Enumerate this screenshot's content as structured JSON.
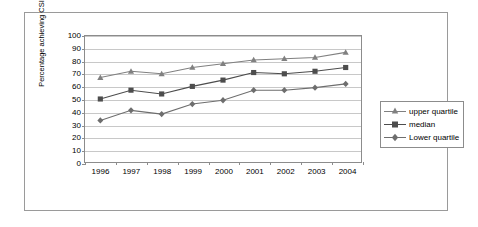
{
  "chart_data": {
    "type": "line",
    "title": "",
    "xlabel": "",
    "ylabel": "Percentage achieving CSI",
    "categories": [
      "1996",
      "1997",
      "1998",
      "1999",
      "2000",
      "2001",
      "2002",
      "2003",
      "2004"
    ],
    "ylim": [
      0,
      100
    ],
    "ytick_values": [
      "0",
      "10",
      "20",
      "30",
      "40",
      "50",
      "60",
      "70",
      "80",
      "90",
      "100"
    ],
    "grid": true,
    "legend_position": "right",
    "series": [
      {
        "name": "upper quartile",
        "marker": "triangle",
        "color": "#808080",
        "values": [
          67,
          72,
          70,
          75,
          78,
          81,
          82,
          83,
          87
        ]
      },
      {
        "name": "median",
        "marker": "square",
        "color": "#4d4d4d",
        "values": [
          50,
          57,
          54,
          60,
          65,
          71,
          70,
          72,
          75
        ]
      },
      {
        "name": "Lower quartile",
        "marker": "diamond",
        "color": "#6e6e6e",
        "values": [
          33,
          41,
          38,
          46,
          49,
          57,
          57,
          59,
          62
        ]
      }
    ]
  },
  "legend": {
    "items": [
      {
        "label": "upper quartile"
      },
      {
        "label": "median"
      },
      {
        "label": "Lower quartile"
      }
    ]
  }
}
